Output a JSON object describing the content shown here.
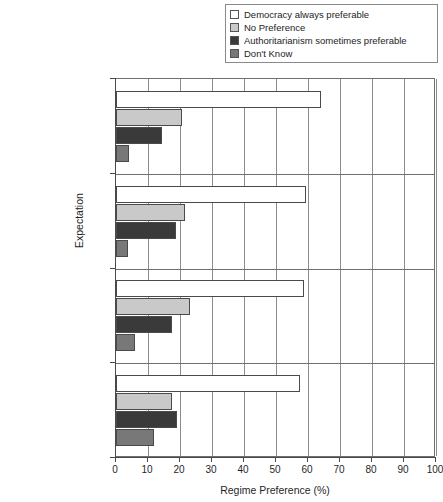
{
  "chart_data": {
    "type": "bar",
    "orientation": "horizontal",
    "title": "",
    "xlabel": "Regime Preference (%)",
    "ylabel": "Expectation",
    "xlim": [
      0,
      100
    ],
    "xticks": [
      0,
      10,
      20,
      30,
      40,
      50,
      60,
      70,
      80,
      90,
      100
    ],
    "grid": true,
    "legend_position": "top-right",
    "categories": [
      "Liberty + Vote",
      "Equality + Welfare",
      "Lawfulness",
      "Other + DK"
    ],
    "series": [
      {
        "name": "Democracy always preferable",
        "color": "#ffffff",
        "values": [
          64.0,
          59.4,
          58.8,
          57.4
        ]
      },
      {
        "name": "No Preference",
        "color": "#c9c9c9",
        "values": [
          20.6,
          21.6,
          23.1,
          17.5
        ]
      },
      {
        "name": "Authoritarianism sometimes preferable",
        "color": "#3a3a3a",
        "values": [
          14.4,
          18.8,
          17.5,
          19.0
        ]
      },
      {
        "name": "Don't Know",
        "color": "#787878",
        "values": [
          4.0,
          3.8,
          5.8,
          11.8
        ]
      }
    ]
  },
  "legend": {
    "items": [
      {
        "label": "Democracy always preferable",
        "color": "#ffffff"
      },
      {
        "label": "No Preference",
        "color": "#c9c9c9"
      },
      {
        "label": "Authoritarianism sometimes preferable",
        "color": "#3a3a3a"
      },
      {
        "label": "Don't Know",
        "color": "#787878"
      }
    ]
  }
}
